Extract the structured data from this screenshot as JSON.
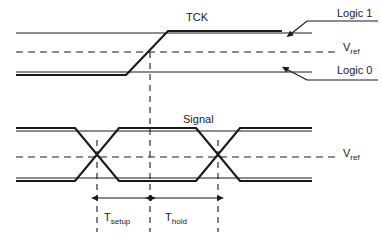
{
  "figure": {
    "type": "timing-diagram",
    "background_color": "#ffffff",
    "line_color": "#1a1a1a"
  },
  "labels": {
    "tck": "TCK",
    "signal": "Signal",
    "logic_high": "Logic 1",
    "logic_low": "Logic 0",
    "vref_symbol": "V",
    "vref_subscript": "ref",
    "t_symbol": "T",
    "tsetup_subscript": "setup",
    "thold_subscript": "hold"
  },
  "geometry": {
    "tck": {
      "logic1_y": 33,
      "vref_y": 52,
      "logic0_y": 72,
      "edge_start_x": 126,
      "edge_end_x": 168,
      "crossing_x": 148,
      "trace_start_x": 16,
      "trace_end_x": 282,
      "refline_end_x": 312
    },
    "signal": {
      "high_y": 131,
      "vref_y": 157,
      "low_y": 178,
      "trace_start_x": 16,
      "trace_end_x": 312,
      "crossing1_x": 97,
      "crossing2_x": 218,
      "transition_half_width": 22
    },
    "reference_line_x": 150,
    "dimension_y": 198,
    "tick_top_y": 185,
    "tick_bottom_y": 232
  },
  "annotations": {
    "vref_dash_pattern": "7 5",
    "clock_edge_marker_x": 150,
    "setup_interval": {
      "from_x": 97,
      "to_x": 150
    },
    "hold_interval": {
      "from_x": 150,
      "to_x": 218
    }
  }
}
